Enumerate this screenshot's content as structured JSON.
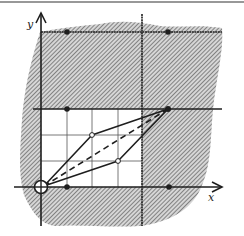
{
  "diagram": {
    "axes": {
      "x_label": "x",
      "y_label": "y"
    },
    "colors": {
      "ink": "#1e1e1e",
      "hatch": "#6a6a6a",
      "region_bg": "#cfcfcf",
      "grid": "#555555",
      "paper": "#ffffff"
    },
    "grid_units": {
      "cells_x": 4,
      "cells_y": 3,
      "description": "unshaded 4x3 grid of unit squares at the origin"
    },
    "points": {
      "origin": {
        "label": "origin",
        "x": 0,
        "y": 0,
        "style": "open-circle-cross"
      },
      "vertex_far": {
        "x": 5,
        "y": 3,
        "style": "filled"
      },
      "vertex_upper": {
        "x": 2,
        "y": 2,
        "style": "open"
      },
      "vertex_lower": {
        "x": 3,
        "y": 1,
        "style": "open"
      },
      "lattice_dots": [
        {
          "x": 1,
          "y": 0
        },
        {
          "x": 5,
          "y": 0
        },
        {
          "x": 1,
          "y": 3
        },
        {
          "x": 1,
          "y": 6
        },
        {
          "x": 5,
          "y": 6
        }
      ]
    },
    "segments": {
      "parallelogram": "origin → (2,2) → (5,3) → (3,1) → origin",
      "diagonal_dashed": "origin → (5,3)"
    }
  }
}
